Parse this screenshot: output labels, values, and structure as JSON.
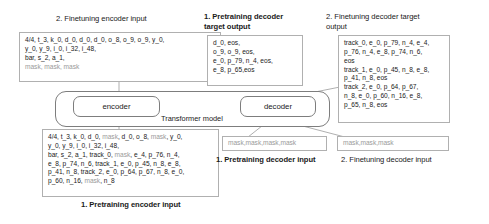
{
  "figure": {
    "model_label": "Transformer model",
    "encoder_label": "encoder",
    "decoder_label": "decoder"
  },
  "captions": {
    "finetuning_encoder_input": "2. Finetuning encoder input",
    "pretraining_decoder_target_output": "1. Pretraining decoder\ntarget output",
    "finetuning_decoder_target_output": "2. Finetuning decoder target\noutput",
    "pretraining_encoder_input": "1. Pretraining encoder input",
    "pretraining_decoder_input": "1. Pretraining decoder input",
    "finetuning_decoder_input": "2. Finetuning decoder input"
  },
  "boxes": {
    "finetuning_encoder_input": {
      "lines": [
        [
          {
            "t": "4/4, t_3, k_0, d_0, d_0, d_0, o_8, o_9, o_9,  y_0,",
            "m": false
          }
        ],
        [
          {
            "t": "y_0, y_9, i_0, i_32, i_48,",
            "m": false
          }
        ],
        [
          {
            "t": "bar, s_2, a_1,",
            "m": false
          }
        ],
        [
          {
            "t": "mask, mask, mask",
            "m": true
          }
        ]
      ]
    },
    "pretraining_decoder_target_output": {
      "lines": [
        [
          {
            "t": "d_0, eos,",
            "m": false
          }
        ],
        [
          {
            "t": "o_9, o_9, eos,",
            "m": false
          }
        ],
        [
          {
            "t": "e_0, p_79, n_4, eos,",
            "m": false
          }
        ],
        [
          {
            "t": "e_8, p_65,eos",
            "m": false
          }
        ]
      ]
    },
    "finetuning_decoder_target_output": {
      "lines": [
        [
          {
            "t": "track_0, e_0, p_79, n_4, e_4,",
            "m": false
          }
        ],
        [
          {
            "t": "p_76, n_4, e_8, p_74, n_6,",
            "m": false
          }
        ],
        [
          {
            "t": "eos",
            "m": false
          }
        ],
        [
          {
            "t": "track_1, e_0, p_45, n_8, e_8,",
            "m": false
          }
        ],
        [
          {
            "t": "p_41, n_8, eos",
            "m": false
          }
        ],
        [
          {
            "t": "track_2, e_0, p_64, p_67,",
            "m": false
          }
        ],
        [
          {
            "t": "n_8, e_0, p_60, n_16, e_8,",
            "m": false
          }
        ],
        [
          {
            "t": "p_65, n_8, eos",
            "m": false
          }
        ]
      ]
    },
    "pretraining_encoder_input": {
      "lines": [
        [
          {
            "t": "4/4, t_3, k_0, d_0, ",
            "m": false
          },
          {
            "t": "mask",
            "m": true
          },
          {
            "t": ", d_0, o_8, ",
            "m": false
          },
          {
            "t": "mask",
            "m": true
          },
          {
            "t": ",  y_0,",
            "m": false
          }
        ],
        [
          {
            "t": "y_0, y_9, i_0, i_32, i_48,",
            "m": false
          }
        ],
        [
          {
            "t": "bar, s_2, a_1, track_0, ",
            "m": false
          },
          {
            "t": "mask",
            "m": true
          },
          {
            "t": ", e_4, p_76, n_4,",
            "m": false
          }
        ],
        [
          {
            "t": "e_8, p_74, n_6, track_1, e_0, p_45, n_8, e_8,",
            "m": false
          }
        ],
        [
          {
            "t": "p_41, n_8, track_2, e_0, p_64, p_67, n_8, e_0,",
            "m": false
          }
        ],
        [
          {
            "t": "p_60, n_16, ",
            "m": false
          },
          {
            "t": "mask",
            "m": true
          },
          {
            "t": ", n_8",
            "m": false
          }
        ]
      ]
    },
    "pretraining_decoder_input": {
      "lines": [
        [
          {
            "t": "mask,mask,mask,mask",
            "m": true
          }
        ]
      ]
    },
    "finetuning_decoder_input": {
      "lines": [
        [
          {
            "t": "mask,mask,mask",
            "m": true
          }
        ]
      ]
    }
  },
  "colors": {
    "text": "#1a1a1a",
    "mask_text": "#9a9a9a",
    "box_border": "#b0b0b0",
    "model_border": "#7d7d7d",
    "connector": "#8c8c8c"
  }
}
